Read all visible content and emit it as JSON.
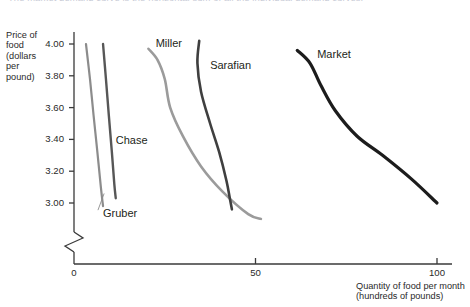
{
  "caption": {
    "text": "The market demand curve is the horizontal sum of all the individual demand curves."
  },
  "axes": {
    "y_title": "Price of\nfood\n(dollars\nper\npound)",
    "x_title": "Quantity of food per month\n(hundreds of pounds)",
    "y_ticks": [
      "4.00",
      "3.80",
      "3.60",
      "3.40",
      "3.20",
      "3.00"
    ],
    "x_ticks": [
      "0",
      "50",
      "100"
    ],
    "axis_color": "#3a3a3a",
    "break_symbol": "axis-break-zigzag"
  },
  "chart_data": {
    "type": "line",
    "title": "The market demand curve is the horizontal sum of all the individual demand curves.",
    "xlabel": "Quantity of food per month (hundreds of pounds)",
    "ylabel": "Price of food (dollars per pound)",
    "xlim": [
      0,
      110
    ],
    "ylim": [
      2.88,
      4.08
    ],
    "xticks": [
      0,
      50,
      100
    ],
    "yticks": [
      4.0,
      3.8,
      3.6,
      3.4,
      3.2,
      3.0
    ],
    "grid": false,
    "legend": "inline-labels",
    "axis_break_x": true,
    "series": [
      {
        "name": "Gruber",
        "color": "#8c8c8c",
        "width": 2.2,
        "label_pos": {
          "x": 8,
          "y": 2.93
        },
        "points": [
          {
            "x": 3.3,
            "y": 4.0
          },
          {
            "x": 4.4,
            "y": 3.78
          },
          {
            "x": 5.4,
            "y": 3.55
          },
          {
            "x": 6.4,
            "y": 3.33
          },
          {
            "x": 7.4,
            "y": 3.1
          },
          {
            "x": 8.0,
            "y": 2.98
          }
        ]
      },
      {
        "name": "Chase",
        "color": "#575757",
        "width": 2.4,
        "label_pos": {
          "x": 11.5,
          "y": 3.39
        },
        "points": [
          {
            "x": 8.0,
            "y": 4.0
          },
          {
            "x": 8.8,
            "y": 3.78
          },
          {
            "x": 9.6,
            "y": 3.55
          },
          {
            "x": 10.4,
            "y": 3.33
          },
          {
            "x": 11.1,
            "y": 3.12
          },
          {
            "x": 11.5,
            "y": 3.03
          }
        ]
      },
      {
        "name": "Miller",
        "color": "#9b9b9b",
        "width": 2.6,
        "label_pos": {
          "x": 22.5,
          "y": 4.0
        },
        "points": [
          {
            "x": 20.5,
            "y": 3.97
          },
          {
            "x": 23.0,
            "y": 3.9
          },
          {
            "x": 25.0,
            "y": 3.78
          },
          {
            "x": 26.5,
            "y": 3.6
          },
          {
            "x": 30.0,
            "y": 3.42
          },
          {
            "x": 35.0,
            "y": 3.23
          },
          {
            "x": 41.0,
            "y": 3.07
          },
          {
            "x": 48.0,
            "y": 2.93
          },
          {
            "x": 51.5,
            "y": 2.9
          }
        ]
      },
      {
        "name": "Sarafian",
        "color": "#3f3f3f",
        "width": 2.6,
        "label_pos": {
          "x": 37.5,
          "y": 3.86
        },
        "points": [
          {
            "x": 34.5,
            "y": 4.02
          },
          {
            "x": 34.0,
            "y": 3.88
          },
          {
            "x": 35.0,
            "y": 3.7
          },
          {
            "x": 37.5,
            "y": 3.5
          },
          {
            "x": 40.0,
            "y": 3.32
          },
          {
            "x": 42.0,
            "y": 3.14
          },
          {
            "x": 43.0,
            "y": 3.02
          },
          {
            "x": 43.5,
            "y": 2.96
          }
        ]
      },
      {
        "name": "Market",
        "color": "#1c1c1c",
        "width": 3.2,
        "label_pos": {
          "x": 67.0,
          "y": 3.93
        },
        "points": [
          {
            "x": 61.5,
            "y": 3.96
          },
          {
            "x": 65.0,
            "y": 3.88
          },
          {
            "x": 68.0,
            "y": 3.74
          },
          {
            "x": 72.0,
            "y": 3.58
          },
          {
            "x": 78.0,
            "y": 3.42
          },
          {
            "x": 85.0,
            "y": 3.3
          },
          {
            "x": 93.0,
            "y": 3.15
          },
          {
            "x": 100.0,
            "y": 3.0
          }
        ]
      }
    ]
  }
}
